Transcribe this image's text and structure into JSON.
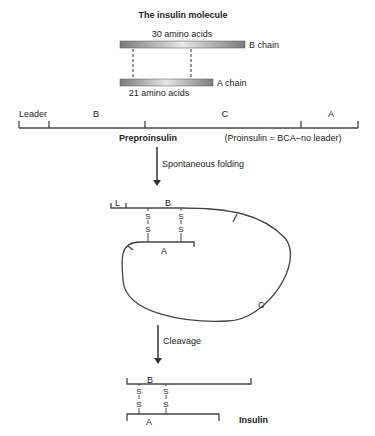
{
  "molecule": {
    "title": "The insulin molecule",
    "b_chain_count": "30 amino acids",
    "b_chain_label": "B chain",
    "a_chain_label": "A chain",
    "a_chain_count": "21 amino acids"
  },
  "preproinsulin": {
    "segments": [
      "Leader",
      "B",
      "C",
      "A"
    ],
    "label": "Preproinsulin",
    "note": "(Proinsulin = BCA–no leader)"
  },
  "step1": {
    "label": "Spontaneous folding"
  },
  "folded": {
    "leader": "L",
    "b": "B",
    "a": "A",
    "c": "C",
    "sulfur": "S"
  },
  "step2": {
    "label": "Cleavage"
  },
  "insulin": {
    "b": "B",
    "a": "A",
    "sulfur": "S",
    "label": "Insulin"
  },
  "colors": {
    "line": "#444444",
    "bar_dark": "#7a7a7a",
    "bar_light": "#e8e8e8"
  }
}
